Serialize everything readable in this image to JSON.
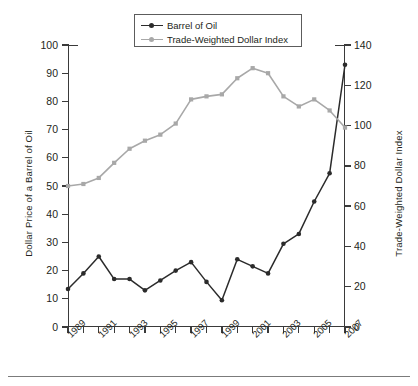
{
  "chart_data": {
    "type": "line",
    "title": "",
    "xlabel": "",
    "ylabel": "Dollar Price of a Barrel of Oil",
    "y2label": "Trade-Weighted Dollar Index",
    "x": [
      1989,
      1990,
      1991,
      1992,
      1993,
      1994,
      1995,
      1996,
      1997,
      1998,
      1999,
      2000,
      2001,
      2002,
      2003,
      2004,
      2005,
      2006,
      2007
    ],
    "xtick_labels": [
      "1989",
      "",
      "1991",
      "",
      "1993",
      "",
      "1995",
      "",
      "1997",
      "",
      "1999",
      "",
      "2001",
      "",
      "2003",
      "",
      "2005",
      "",
      "2007"
    ],
    "xlim": [
      1989,
      2007
    ],
    "ylim": [
      0,
      100
    ],
    "y2lim": [
      0,
      140
    ],
    "yticks": [
      0,
      10,
      20,
      30,
      40,
      50,
      60,
      70,
      80,
      90,
      100
    ],
    "y2ticks": [
      0,
      20,
      40,
      60,
      80,
      100,
      120,
      140
    ],
    "grid": false,
    "legend_position": "top-center",
    "series": [
      {
        "name": "Barrel of Oil",
        "axis": "left",
        "color": "#2b2b2b",
        "marker": "circle",
        "values": [
          13.5,
          19.0,
          25.0,
          17.0,
          17.0,
          13.0,
          16.5,
          20.0,
          23.0,
          16.0,
          9.5,
          24.0,
          21.5,
          19.0,
          29.5,
          33.0,
          44.5,
          54.5,
          93.0
        ]
      },
      {
        "name": "Trade-Weighted Dollar Index",
        "axis": "right",
        "color": "#a8a8a8",
        "marker": "square",
        "values": [
          70.0,
          71.0,
          74.0,
          81.5,
          88.5,
          92.5,
          95.5,
          101.0,
          113.0,
          114.5,
          115.5,
          123.5,
          128.5,
          126.0,
          114.5,
          109.5,
          113.0,
          107.5,
          99.0
        ]
      }
    ]
  },
  "legend": {
    "items": [
      {
        "label": "Barrel of Oil",
        "color": "#2b2b2b"
      },
      {
        "label": "Trade-Weighted Dollar Index",
        "color": "#a8a8a8"
      }
    ]
  },
  "axes": {
    "left_title": "Dollar Price of a Barrel of Oil",
    "right_title": "Trade-Weighted Dollar Index",
    "left_ticks": [
      "100",
      "90",
      "80",
      "70",
      "60",
      "50",
      "40",
      "30",
      "20",
      "10",
      "0"
    ],
    "right_ticks": [
      "140",
      "120",
      "100",
      "80",
      "60",
      "40",
      "20",
      "0"
    ],
    "x_labels": [
      "1989",
      "1991",
      "1993",
      "1995",
      "1997",
      "1999",
      "2001",
      "2003",
      "2005",
      "2007"
    ]
  }
}
